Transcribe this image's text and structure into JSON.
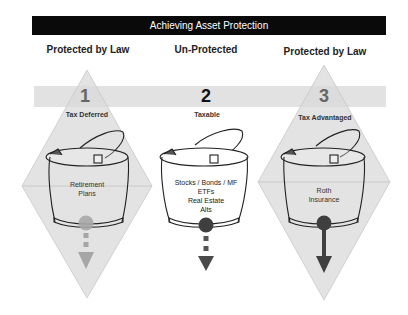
{
  "title": "Achieving Asset Protection",
  "colors": {
    "banner_bg": "#0a0a0a",
    "banner_text": "#ffffff",
    "band": "#e2e2e2",
    "diamond_fill": "#d9d9d9",
    "arrow_light": "#a6a6a6",
    "arrow_dark": "#3f3f3f"
  },
  "columns": [
    {
      "heading": "Protected by Law",
      "number": "1",
      "category": "Tax Deferred",
      "contents": [
        "Retirement",
        "Plans"
      ],
      "shield": "diamond",
      "arrow": "dashed-light"
    },
    {
      "heading": "Un-Protected",
      "number": "2",
      "category": "Taxable",
      "contents": [
        "Stocks / Bonds / MF",
        "ETFs",
        "Real Estate",
        "Alts"
      ],
      "shield": "none",
      "arrow": "dashed-dark"
    },
    {
      "heading": "Protected by Law",
      "number": "3",
      "category": "Tax Advantaged",
      "contents": [
        "Roth",
        "Insurance"
      ],
      "shield": "diamond",
      "arrow": "solid-dark"
    }
  ]
}
